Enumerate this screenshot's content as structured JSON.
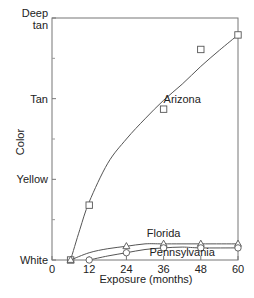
{
  "chart_data": {
    "type": "line",
    "title": "",
    "xlabel": "Exposure (months)",
    "ylabel": "Color",
    "xlim": [
      0,
      60
    ],
    "ylim": [
      0,
      3
    ],
    "x_ticks": [
      0,
      12,
      24,
      36,
      48,
      60
    ],
    "y_ticks": [
      {
        "value": 0,
        "label": "White"
      },
      {
        "value": 1,
        "label": "Yellow"
      },
      {
        "value": 2,
        "label": "Tan"
      },
      {
        "value": 3,
        "label": "Deep tan"
      }
    ],
    "y_minor_ticks": [
      0.5,
      1.5,
      2.5
    ],
    "grid": false,
    "legend": "inline labels",
    "series": [
      {
        "name": "Arizona",
        "marker": "square",
        "points": [
          [
            6,
            0
          ],
          [
            12,
            0.68
          ],
          [
            36,
            1.87
          ],
          [
            48,
            2.61
          ],
          [
            60,
            2.79
          ]
        ],
        "curve": [
          [
            6,
            0
          ],
          [
            9,
            0.38
          ],
          [
            12,
            0.72
          ],
          [
            18,
            1.2
          ],
          [
            24,
            1.5
          ],
          [
            30,
            1.75
          ],
          [
            36,
            1.98
          ],
          [
            42,
            2.18
          ],
          [
            48,
            2.4
          ],
          [
            54,
            2.6
          ],
          [
            60,
            2.79
          ]
        ]
      },
      {
        "name": "Florida",
        "marker": "triangle",
        "points": [
          [
            6,
            0
          ],
          [
            24,
            0.17
          ],
          [
            36,
            0.2
          ],
          [
            48,
            0.2
          ],
          [
            60,
            0.2
          ]
        ],
        "curve": [
          [
            6,
            0
          ],
          [
            12,
            0.09
          ],
          [
            18,
            0.14
          ],
          [
            24,
            0.17
          ],
          [
            30,
            0.2
          ],
          [
            36,
            0.2
          ],
          [
            48,
            0.2
          ],
          [
            60,
            0.2
          ]
        ]
      },
      {
        "name": "Pennsylvania",
        "marker": "circle",
        "points": [
          [
            12,
            0
          ],
          [
            24,
            0.09
          ],
          [
            36,
            0.15
          ],
          [
            48,
            0.15
          ],
          [
            60,
            0.15
          ]
        ],
        "curve": [
          [
            12,
            0
          ],
          [
            18,
            0.05
          ],
          [
            24,
            0.09
          ],
          [
            30,
            0.13
          ],
          [
            36,
            0.15
          ],
          [
            42,
            0.16
          ],
          [
            48,
            0.15
          ],
          [
            60,
            0.15
          ]
        ]
      }
    ],
    "label_positions": {
      "Arizona": [
        42,
        1.95
      ],
      "Florida": [
        36,
        0.28
      ],
      "Pennsylvania": [
        42,
        0.05
      ]
    }
  }
}
